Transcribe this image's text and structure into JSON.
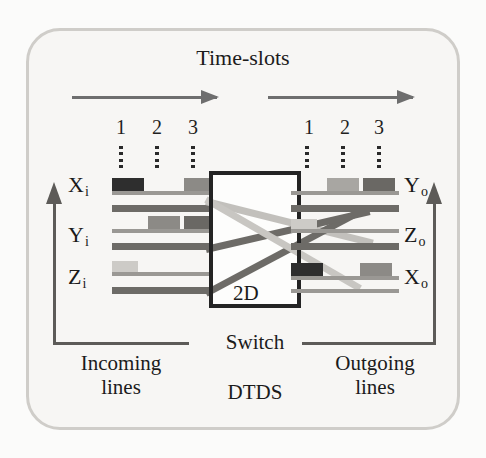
{
  "figure": {
    "title": "Time-slots",
    "switch_label_2d": "2D",
    "switch_caption": "Switch",
    "switch_sublabel": "DTDS"
  },
  "colors": {
    "background": "#f7f6f4",
    "frame_border": "#cfcdc9",
    "rail_thin": "#9a9894",
    "rail_thick": "#6d6b67",
    "switch_border": "#242424",
    "arrow": "#6e6e6e",
    "bracket": "#5d5b58",
    "packet_dark": "#2e2e2e",
    "packet_medium": "#8c8a86",
    "packet_light": "#c9c7c3",
    "link_light": "#c2c0bc",
    "link_dark": "#6d6b67"
  },
  "time_slots": {
    "left_numbers": [
      "1",
      "2",
      "3"
    ],
    "right_numbers": [
      "1",
      "2",
      "3"
    ],
    "arrow_count": 2
  },
  "incoming": {
    "caption_line1": "Incoming",
    "caption_line2": "lines",
    "lines": [
      {
        "name": "X",
        "sub": "i",
        "label": "Xi",
        "packets": [
          {
            "slot": 1,
            "shade": "dark"
          },
          {
            "slot": 3,
            "shade": "medium"
          }
        ]
      },
      {
        "name": "Y",
        "sub": "i",
        "label": "Yi",
        "packets": [
          {
            "slot": 2,
            "shade": "medium"
          },
          {
            "slot": 3,
            "shade": "dark"
          }
        ]
      },
      {
        "name": "Z",
        "sub": "i",
        "label": "Zi",
        "packets": [
          {
            "slot": 1,
            "shade": "light"
          }
        ]
      }
    ]
  },
  "outgoing": {
    "caption_line1": "Outgoing",
    "caption_line2": "lines",
    "lines": [
      {
        "name": "Y",
        "sub": "o",
        "label": "Yo",
        "packets": [
          {
            "slot": 2,
            "shade": "medium"
          },
          {
            "slot": 3,
            "shade": "dark"
          }
        ]
      },
      {
        "name": "Z",
        "sub": "o",
        "label": "Zo",
        "packets": [
          {
            "slot": 1,
            "shade": "light"
          }
        ]
      },
      {
        "name": "X",
        "sub": "o",
        "label": "Xo",
        "packets": [
          {
            "slot": 1,
            "shade": "dark"
          },
          {
            "slot": 3,
            "shade": "medium"
          }
        ]
      }
    ]
  },
  "routing": [
    {
      "from": "Xi",
      "to": "Zo",
      "style": "light"
    },
    {
      "from": "Yi",
      "to": "Yo",
      "style": "dark"
    },
    {
      "from": "Zi",
      "to": "Xo",
      "style": "light"
    }
  ]
}
